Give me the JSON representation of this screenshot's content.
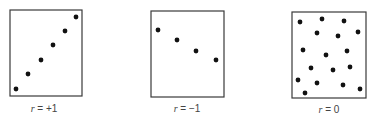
{
  "chart_data": [
    {
      "type": "scatter",
      "title": "",
      "label": "r = +1",
      "r": 1,
      "xlabel": "",
      "ylabel": "",
      "frame": {
        "x": 10,
        "y": 10,
        "w": 72,
        "h": 86
      },
      "points": [
        [
          16,
          89
        ],
        [
          28,
          74
        ],
        [
          41,
          60
        ],
        [
          53,
          45
        ],
        [
          65,
          31
        ],
        [
          76,
          17
        ]
      ]
    },
    {
      "type": "scatter",
      "title": "",
      "label": "r = −1",
      "r": -1,
      "xlabel": "",
      "ylabel": "",
      "frame": {
        "x": 151,
        "y": 11,
        "w": 73,
        "h": 86
      },
      "points": [
        [
          158,
          30
        ],
        [
          177,
          40
        ],
        [
          196,
          51
        ],
        [
          216,
          60
        ]
      ]
    },
    {
      "type": "scatter",
      "title": "",
      "label": "r = 0",
      "r": 0,
      "xlabel": "",
      "ylabel": "",
      "frame": {
        "x": 292,
        "y": 12,
        "w": 74,
        "h": 86
      },
      "points": [
        [
          300,
          22
        ],
        [
          322,
          19
        ],
        [
          344,
          21
        ],
        [
          317,
          33
        ],
        [
          338,
          36
        ],
        [
          358,
          32
        ],
        [
          303,
          50
        ],
        [
          326,
          55
        ],
        [
          347,
          51
        ],
        [
          311,
          68
        ],
        [
          333,
          70
        ],
        [
          350,
          67
        ],
        [
          298,
          80
        ],
        [
          317,
          83
        ],
        [
          343,
          85
        ],
        [
          360,
          89
        ],
        [
          305,
          93
        ]
      ]
    }
  ],
  "labels": {
    "plot1": {
      "var": "r",
      "rest": " = +1"
    },
    "plot2": {
      "var": "r",
      "rest": " = −1"
    },
    "plot3": {
      "var": "r",
      "rest": " = 0"
    }
  }
}
